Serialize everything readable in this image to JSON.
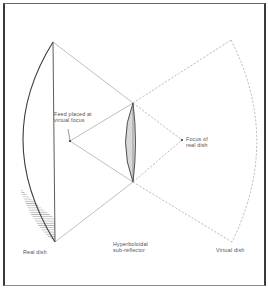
{
  "diagram": {
    "labels": {
      "feed": "Feed placed at\nvirtual focus",
      "focus": "Focus of\nreal dish",
      "real_dish": "Real dish",
      "sub_reflector": "Hyperboloidal\nsub-reflector",
      "virtual_dish": "Virtual dish"
    },
    "colors": {
      "line": "#444444",
      "thin_line": "#7a7a7a",
      "dashed": "#8a8a8a",
      "hatch": "#888888",
      "subreflector_fill": "#d8d8d8",
      "background": "#ffffff"
    },
    "points": {
      "real_dish_top": [
        53,
        42
      ],
      "real_dish_bottom": [
        55,
        242
      ],
      "sub_top": [
        133,
        103
      ],
      "sub_bottom": [
        133,
        182
      ],
      "feed": [
        70,
        141
      ],
      "focus": [
        182,
        140
      ],
      "virtual_dish_top": [
        231,
        40
      ],
      "virtual_dish_bottom": [
        232,
        242
      ]
    }
  }
}
